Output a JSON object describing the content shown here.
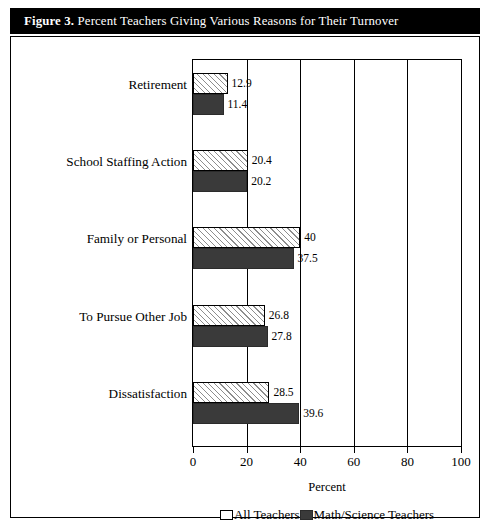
{
  "figure": {
    "label": "Figure 3.",
    "title": "Percent Teachers Giving Various Reasons for Their Turnover",
    "colors": {
      "title_bar_background": "#000000",
      "title_bar_text": "#ffffff",
      "all_teachers_series": "#ffffff",
      "math_science_series": "#3a3a3a",
      "frame": "#000000"
    }
  },
  "chart_data": {
    "type": "bar",
    "orientation": "horizontal",
    "title": "Percent Teachers Giving Various Reasons for Their Turnover",
    "xlabel": "Percent",
    "ylabel": "",
    "xlim": [
      0,
      100
    ],
    "xticks": [
      0,
      20,
      40,
      60,
      80,
      100
    ],
    "xtick_labels": [
      "0",
      "20",
      "40",
      "60",
      "80",
      "100"
    ],
    "grid": true,
    "legend_position": "bottom",
    "categories": [
      "Retirement",
      "School Staffing Action",
      "Family or Personal",
      "To Pursue Other Job",
      "Dissatisfaction"
    ],
    "series": [
      {
        "name": "All Teachers",
        "color": "#ffffff",
        "pattern": "diagonal-hatch",
        "values": [
          12.9,
          20.4,
          40,
          26.8,
          28.5
        ],
        "value_labels": [
          "12.9",
          "20.4",
          "40",
          "26.8",
          "28.5"
        ]
      },
      {
        "name": "Math/Science Teachers",
        "color": "#3a3a3a",
        "pattern": "solid",
        "values": [
          11.4,
          20.2,
          37.5,
          27.8,
          39.6
        ],
        "value_labels": [
          "11.4",
          "20.2",
          "37.5",
          "27.8",
          "39.6"
        ]
      }
    ]
  },
  "legend": {
    "items": [
      {
        "label": "All Teachers",
        "swatch": "all"
      },
      {
        "label": "Math/Science Teachers",
        "swatch": "math"
      }
    ]
  }
}
